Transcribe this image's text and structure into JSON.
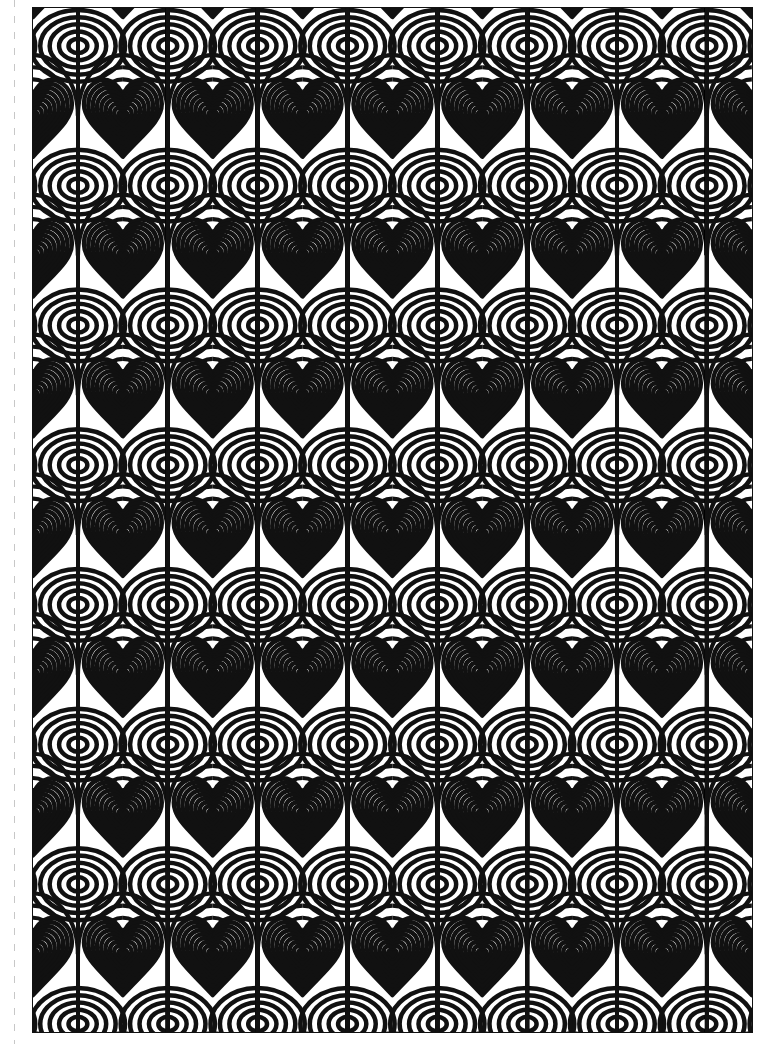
{
  "page": {
    "width": 767,
    "height": 1044,
    "background_color": "#ffffff",
    "ink_color": "#111111"
  },
  "fold_line": {
    "name": "perforation-line",
    "x": 14,
    "dash_color": "#000000",
    "opacity": 0.22
  },
  "artwork": {
    "frame": {
      "x": 32,
      "y": 7,
      "width": 721,
      "height": 1026,
      "border_color": "#111111",
      "border_width": 1
    },
    "caption": "",
    "motif_names": [
      "concentric-heart",
      "concentric-diamond-large",
      "concentric-diamond-small",
      "radiating-arc-field"
    ]
  },
  "chart_data": {
    "type": "heatmap",
    "xlabel": "",
    "ylabel": "",
    "grid": false,
    "legend": "none",
    "palette": [
      "#ffffff",
      "#111111"
    ],
    "tile": {
      "cell_width": 90.1,
      "cell_height": 140.0,
      "columns": 8,
      "rows": 7.4,
      "origin_x": 0,
      "origin_y": -32
    },
    "stripes": {
      "period_px": 9.0,
      "ink_fraction": 0.5,
      "heart_rings": 9,
      "diamond_rings_large": 11,
      "diamond_rings_small": 4
    },
    "motifs": [
      {
        "name": "concentric-heart",
        "count_x": 8,
        "count_y": 8,
        "size": 78
      },
      {
        "name": "concentric-diamond-large",
        "count_x": 8,
        "count_y": 4,
        "rx": 44,
        "ry": 38
      },
      {
        "name": "concentric-diamond-small",
        "count_x": 8,
        "count_y": 4,
        "rx": 14,
        "ry": 12
      }
    ],
    "categories": [
      "heart-row",
      "large-diamond-row",
      "heart-row",
      "small-diamond-row"
    ],
    "values": [
      1,
      0,
      1,
      0
    ]
  }
}
